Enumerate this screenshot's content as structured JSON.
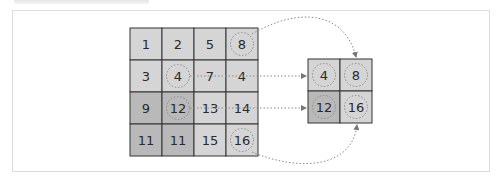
{
  "figure": {
    "type": "max-pooling-diagram",
    "colors": {
      "light_cell": "#d5d5d5",
      "dark_cell": "#b9b9b9",
      "grid_line": "#333333",
      "dotted": "#8a8a8a",
      "frame_border": "#dcdcdc"
    }
  },
  "input_grid": {
    "rows": 4,
    "cols": 4,
    "cells": [
      [
        {
          "value": "1",
          "shade": "light",
          "circled": false
        },
        {
          "value": "2",
          "shade": "light",
          "circled": false
        },
        {
          "value": "5",
          "shade": "light",
          "circled": false
        },
        {
          "value": "8",
          "shade": "light",
          "circled": true
        }
      ],
      [
        {
          "value": "3",
          "shade": "light",
          "circled": false
        },
        {
          "value": "4",
          "shade": "light",
          "circled": true
        },
        {
          "value": "7",
          "shade": "light",
          "circled": false
        },
        {
          "value": "4",
          "shade": "light",
          "circled": false
        }
      ],
      [
        {
          "value": "9",
          "shade": "dark",
          "circled": false
        },
        {
          "value": "12",
          "shade": "dark",
          "circled": true
        },
        {
          "value": "13",
          "shade": "light",
          "circled": false
        },
        {
          "value": "14",
          "shade": "light",
          "circled": false
        }
      ],
      [
        {
          "value": "11",
          "shade": "dark",
          "circled": false
        },
        {
          "value": "11",
          "shade": "dark",
          "circled": false
        },
        {
          "value": "15",
          "shade": "light",
          "circled": false
        },
        {
          "value": "16",
          "shade": "light",
          "circled": true
        }
      ]
    ]
  },
  "output_grid": {
    "rows": 2,
    "cols": 2,
    "cells": [
      [
        {
          "value": "4",
          "shade": "light",
          "circled": true
        },
        {
          "value": "8",
          "shade": "light",
          "circled": true
        }
      ],
      [
        {
          "value": "12",
          "shade": "dark",
          "circled": true
        },
        {
          "value": "16",
          "shade": "light",
          "circled": true
        }
      ]
    ]
  }
}
